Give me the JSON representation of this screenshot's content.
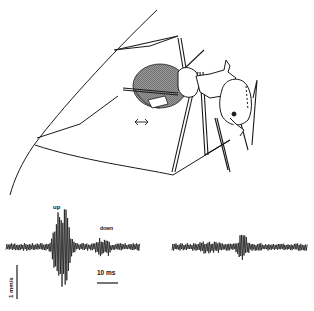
{
  "figure": {
    "panel_top": {
      "subject": "ant on leaf edge",
      "arrow_symbol": "double-headed arrow",
      "wing_pattern": "hatched"
    },
    "trace_left": {
      "label_up": "up",
      "label_down": "down",
      "baseline_y": 247,
      "x_start": 6,
      "x_end": 140
    },
    "trace_right": {
      "baseline_y": 247,
      "x_start": 172,
      "x_end": 308
    },
    "scale_bars": {
      "time_label": "10 ms",
      "amplitude_label": "1 mm/s"
    }
  },
  "colors": {
    "ink": "#1a1a1a",
    "hatch": "#555555",
    "background": "#ffffff"
  }
}
